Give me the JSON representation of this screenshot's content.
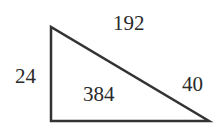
{
  "diagram": {
    "shape": "right-triangle",
    "stroke_color": "#333333",
    "labels": {
      "top": "192",
      "left": "24",
      "center": "384",
      "hypotenuse": "40"
    },
    "vertices": [
      [
        51,
        27
      ],
      [
        51,
        121
      ],
      [
        209,
        121
      ]
    ]
  }
}
